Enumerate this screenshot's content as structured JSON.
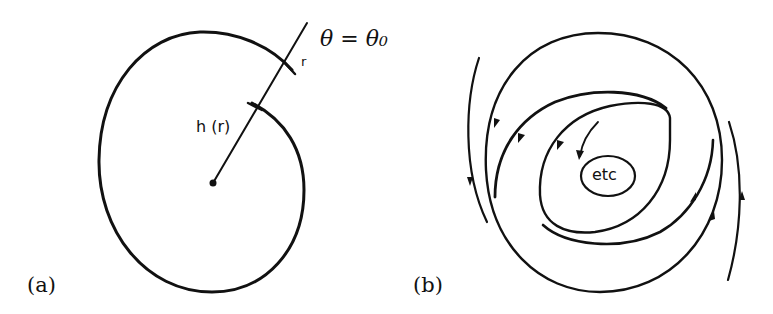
{
  "figure": {
    "panel_a": {
      "label": "(a)",
      "ray_label": "θ = θ₀",
      "outer_mark_label": "r",
      "inner_mark_label": "h (r)",
      "description": "Spiral curve around a central point, cut by a radial line θ = θ₀ marking successive crossings r and h(r)"
    },
    "panel_b": {
      "label": "(b)",
      "center_label": "etc",
      "description": "Nested spiral flow lines with direction arrows converging toward the center"
    },
    "colors": {
      "ink": "#111111",
      "background": "#ffffff"
    }
  }
}
